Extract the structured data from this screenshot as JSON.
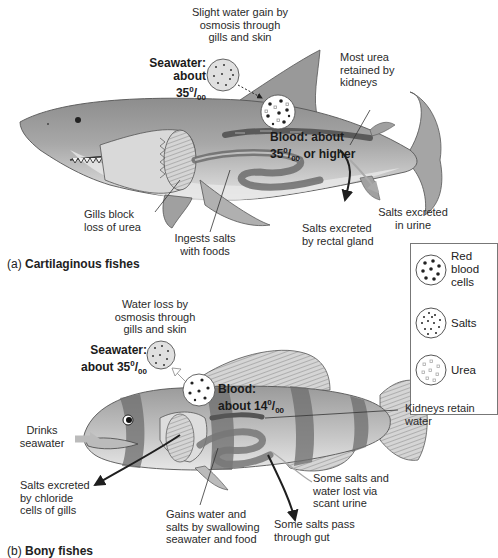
{
  "figure": {
    "panel_a": {
      "caption_letter": "(a)",
      "caption_title": "Cartilaginous fishes",
      "labels": {
        "water_gain": "Slight water gain by osmosis through gills and skin",
        "water_gain_l1": "Slight water gain by",
        "water_gain_l2": "osmosis through",
        "water_gain_l3": "gills and skin",
        "seawater_l1": "Seawater:",
        "seawater_l2": "about 35",
        "seawater_sup": "0",
        "seawater_sub": "00",
        "blood_l1": "Blood: about",
        "blood_l2a": "35",
        "blood_sup": "0",
        "blood_sub": "00",
        "blood_l2b": " or higher",
        "urea_l1": "Most urea",
        "urea_l2": "retained by",
        "urea_l3": "kidneys",
        "gills_l1": "Gills block",
        "gills_l2": "loss of urea",
        "ingests_l1": "Ingests salts",
        "ingests_l2": "with foods",
        "rectal_l1": "Salts excreted",
        "rectal_l2": "by rectal gland",
        "urine_l1": "Salts excreted",
        "urine_l2": "in urine"
      }
    },
    "panel_b": {
      "caption_letter": "(b)",
      "caption_title": "Bony fishes",
      "labels": {
        "water_loss_l1": "Water loss by",
        "water_loss_l2": "osmosis through",
        "water_loss_l3": "gills and skin",
        "seawater_l1": "Seawater:",
        "seawater_l2": "about 35",
        "seawater_sup": "0",
        "seawater_sub": "00",
        "blood_l1": "Blood:",
        "blood_l2": "about 14",
        "blood_sup": "0",
        "blood_sub": "00",
        "drinks_l1": "Drinks",
        "drinks_l2": "seawater",
        "kidneys_l1": "Kidneys retain",
        "kidneys_l2": "water",
        "chloride_l1": "Salts excreted",
        "chloride_l2": "by chloride",
        "chloride_l3": "cells of gills",
        "gains_l1": "Gains water and",
        "gains_l2": "salts by swallowing",
        "gains_l3": "seawater and food",
        "urine_l1": "Some salts and",
        "urine_l2": "water lost via",
        "urine_l3": "scant urine",
        "gut_l1": "Some salts pass",
        "gut_l2": "through gut"
      }
    },
    "legend": {
      "items": [
        {
          "label_l1": "Red",
          "label_l2": "blood",
          "label_l3": "cells",
          "icon": "large-dark-dots-circle"
        },
        {
          "label_l1": "Salts",
          "icon": "small-dark-dots-circle"
        },
        {
          "label_l1": "Urea",
          "icon": "light-squares-circle"
        }
      ]
    },
    "colors": {
      "body_gray": "#9a9a9a",
      "dark_arrow": "#1f1f1f",
      "light_arrow": "#b8b8b8",
      "legend_border": "#777777"
    }
  }
}
